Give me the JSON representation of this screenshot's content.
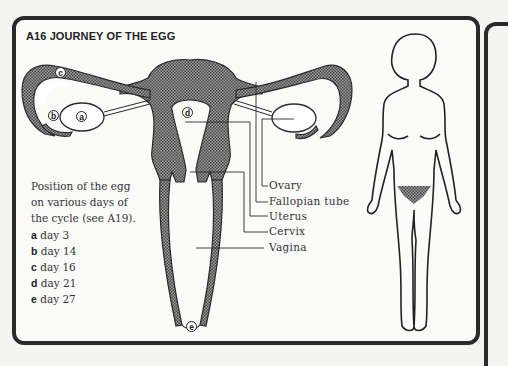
{
  "title": "A16 JOURNEY OF THE EGG",
  "caption": {
    "lines": [
      "Position of the egg",
      "on various days of",
      "the cycle (see A19)."
    ],
    "items": [
      {
        "letter": "a",
        "text": "day 3"
      },
      {
        "letter": "b",
        "text": "day 14"
      },
      {
        "letter": "c",
        "text": "day 16"
      },
      {
        "letter": "d",
        "text": "day 21"
      },
      {
        "letter": "e",
        "text": "day 27"
      }
    ]
  },
  "labels": {
    "ovary": "Ovary",
    "fallopian_tube": "Fallopian tube",
    "uterus": "Uterus",
    "cervix": "Cervix",
    "vagina": "Vagina"
  },
  "markers": {
    "a": "a",
    "b": "b",
    "c": "c",
    "d": "d",
    "e": "e"
  },
  "colors": {
    "outline": "#2a2a2a",
    "hatch": "#6e6e6e",
    "background": "#fbfbfa"
  }
}
